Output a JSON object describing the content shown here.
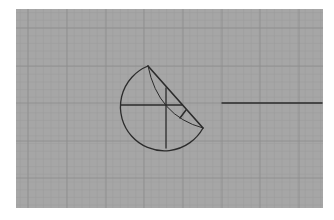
{
  "diagram": {
    "kind": "geometric-construction-on-grid",
    "background": {
      "page_color": "#ffffff",
      "panel_color": "#a6a6a6",
      "panel": {
        "x": 16,
        "y": 9,
        "width": 307,
        "height": 199
      },
      "major_grid_color": "#8e8e8e",
      "minor_grid_color": "#9d9d9d",
      "major_grid_x": [
        28,
        67,
        106,
        144,
        183,
        222,
        260,
        299
      ],
      "major_grid_y": [
        28,
        66,
        103,
        141,
        178
      ],
      "minor_step": 7.7
    },
    "stroke_color": "#2b2b2b",
    "shapes": {
      "outer_arc": {
        "from": [
          148,
          66
        ],
        "to": [
          203,
          128
        ],
        "center": [
          166,
          105
        ],
        "note": "large arc sweeping left and down"
      },
      "chord": {
        "from": [
          148,
          66
        ],
        "to": [
          203,
          128
        ]
      },
      "inner_arc": {
        "from": [
          148,
          66
        ],
        "to": [
          203,
          128
        ],
        "note": "curve bulging toward lower-left"
      },
      "horizontal_diameter": {
        "from": [
          121,
          105
        ],
        "to": [
          182,
          105
        ]
      },
      "vertical_line": {
        "from": [
          166,
          88
        ],
        "to": [
          166,
          148
        ]
      },
      "perpendicular_tick": {
        "from": [
          186,
          110
        ],
        "to": [
          180,
          118
        ]
      },
      "right_axis_line": {
        "from": [
          222,
          103
        ],
        "to": [
          322,
          103
        ]
      }
    }
  }
}
